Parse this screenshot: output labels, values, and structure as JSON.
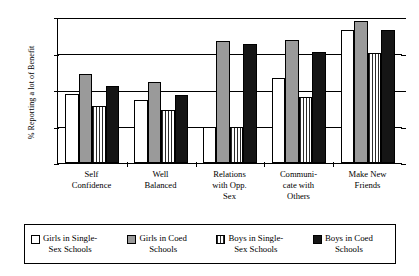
{
  "chart_data": {
    "type": "bar",
    "title": "",
    "xlabel": "",
    "ylabel": "% Reporting a lot of Benefit",
    "ylim": [
      0,
      80
    ],
    "yticks": [
      0,
      20,
      40,
      60,
      80
    ],
    "grid": true,
    "legend_position": "bottom",
    "categories": [
      "Self Confidence",
      "Well Balanced",
      "Relations with Opp. Sex",
      "Communicate with Others",
      "Make New Friends"
    ],
    "category_lines": [
      [
        "Self",
        "Confidence"
      ],
      [
        "Well",
        "Balanced"
      ],
      [
        "Relations",
        "with Opp.",
        "Sex"
      ],
      [
        "Communi-",
        "cate with",
        "Others"
      ],
      [
        "Make New",
        "Friends"
      ]
    ],
    "series": [
      {
        "name": "Girls in Single-Sex Schools",
        "name_lines": [
          "Girls in Single-",
          "Sex Schools"
        ],
        "fill": "white",
        "values": [
          38,
          34.5,
          19.5,
          46.5,
          73
        ]
      },
      {
        "name": "Girls in Coed Schools",
        "name_lines": [
          "Girls in Coed",
          "Schools"
        ],
        "fill": "gray",
        "values": [
          49,
          44.5,
          67,
          67.5,
          78
        ]
      },
      {
        "name": "Boys in Single-Sex Schools",
        "name_lines": [
          "Boys in Single-",
          "Sex Schools"
        ],
        "fill": "vertical-stripes",
        "values": [
          31,
          29,
          19.5,
          36,
          60.5
        ]
      },
      {
        "name": "Boys in Coed Schools",
        "name_lines": [
          "Boys in Coed",
          "Schools"
        ],
        "fill": "black",
        "values": [
          42,
          37.5,
          65,
          61,
          73
        ]
      }
    ]
  },
  "colors": {
    "axis": "#000000",
    "series_white": "#ffffff",
    "series_gray": "#9a9a9a",
    "series_striped": "#2b2b2b",
    "series_black": "#151515",
    "background": "#ffffff"
  }
}
